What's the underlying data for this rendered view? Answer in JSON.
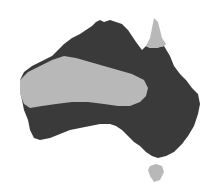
{
  "map": {
    "subject": "Australia",
    "colors": {
      "background": "#ffffff",
      "dark_region": "#3a3a3a",
      "light_region": "#b8b8b8"
    },
    "regions": [
      {
        "name": "dark-region",
        "shade": "dark"
      },
      {
        "name": "light-band-region",
        "shade": "light"
      },
      {
        "name": "cape-york-region",
        "shade": "light"
      },
      {
        "name": "tasmania-region",
        "shade": "light"
      }
    ]
  }
}
